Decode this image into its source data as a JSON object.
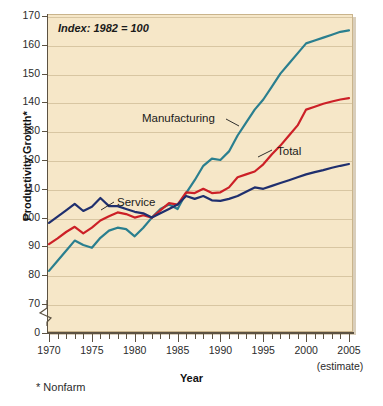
{
  "chart_data": {
    "type": "line",
    "title": "",
    "annotation": "Index: 1982 = 100",
    "xlabel": "Year",
    "ylabel": "Productivity Growth*",
    "footnote": "* Nonfarm",
    "estimate_note": "(estimate)",
    "xlim": [
      1970,
      2005
    ],
    "ylim": [
      70,
      170
    ],
    "y_axis_break": true,
    "y_zero_label": "0",
    "grid": true,
    "grid_axis": "y",
    "legend_position": "inline-annotations",
    "x_tick_labels": [
      "1970",
      "1975",
      "1980",
      "1985",
      "1990",
      "1995",
      "2000",
      "2005"
    ],
    "x_tick_values": [
      1970,
      1975,
      1980,
      1985,
      1990,
      1995,
      2000,
      2005
    ],
    "x_minor_tick_interval": 1,
    "y_tick_labels": [
      "170",
      "160",
      "150",
      "140",
      "130",
      "120",
      "110",
      "100",
      "90",
      "80",
      "70",
      "0"
    ],
    "y_tick_values": [
      170,
      160,
      150,
      140,
      130,
      120,
      110,
      100,
      90,
      80,
      70,
      0
    ],
    "x": [
      1970,
      1971,
      1972,
      1973,
      1974,
      1975,
      1976,
      1977,
      1978,
      1979,
      1980,
      1981,
      1982,
      1983,
      1984,
      1985,
      1986,
      1987,
      1988,
      1989,
      1990,
      1991,
      1992,
      1993,
      1994,
      1995,
      1996,
      1997,
      1998,
      1999,
      2000,
      2001,
      2002,
      2003,
      2004,
      2005
    ],
    "series": [
      {
        "name": "Manufacturing",
        "color": "#2a7f8f",
        "label_position": "left-of-line",
        "values": [
          81.5,
          85.0,
          88.5,
          92.0,
          90.5,
          89.5,
          93.0,
          95.5,
          96.5,
          96.0,
          93.5,
          96.5,
          100.0,
          103.0,
          104.5,
          103.0,
          108.5,
          113.0,
          118.0,
          120.5,
          120.0,
          123.0,
          128.5,
          133.0,
          137.5,
          141.0,
          145.5,
          150.0,
          153.5,
          157.0,
          160.5,
          161.5,
          162.5,
          163.5,
          164.5,
          165.0
        ]
      },
      {
        "name": "Total",
        "color": "#cc2027",
        "label_position": "right-of-line",
        "values": [
          90.8,
          92.8,
          95.0,
          96.8,
          94.5,
          96.5,
          99.0,
          100.5,
          101.8,
          101.2,
          100.0,
          100.8,
          100.0,
          102.5,
          105.0,
          104.5,
          108.8,
          108.5,
          110.0,
          108.5,
          108.8,
          110.5,
          114.0,
          115.0,
          116.0,
          118.5,
          122.0,
          125.0,
          128.5,
          132.0,
          137.5,
          138.5,
          139.5,
          140.3,
          141.0,
          141.5
        ]
      },
      {
        "name": "Service",
        "color": "#1f2f6e",
        "label_position": "right-of-line",
        "values": [
          98.2,
          100.3,
          102.5,
          104.8,
          102.3,
          103.8,
          106.8,
          104.0,
          104.0,
          103.0,
          102.0,
          101.5,
          100.0,
          101.5,
          103.0,
          104.5,
          107.5,
          106.5,
          107.5,
          106.0,
          105.8,
          106.5,
          107.5,
          109.0,
          110.5,
          110.0,
          111.0,
          112.0,
          113.0,
          114.0,
          115.0,
          115.8,
          116.5,
          117.3,
          118.0,
          118.6
        ]
      }
    ],
    "series_labels": [
      {
        "text": "Manufacturing",
        "color": "#1a1a1a"
      },
      {
        "text": "Total",
        "color": "#1a1a1a"
      },
      {
        "text": "Service",
        "color": "#1a1a1a"
      }
    ],
    "colors": {
      "manufacturing": "#2a7f8f",
      "total": "#cc2027",
      "service": "#1f2f6e",
      "panel_background": "#f6e7c8",
      "gridline": "#d8c6a2",
      "axis": "#5c5242"
    }
  }
}
